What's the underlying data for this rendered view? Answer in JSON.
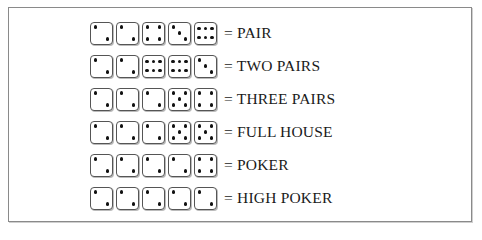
{
  "hands": [
    {
      "dice": [
        2,
        2,
        4,
        3,
        6
      ],
      "label": "= PAIR"
    },
    {
      "dice": [
        2,
        2,
        6,
        6,
        3
      ],
      "label": "= TWO PAIRS"
    },
    {
      "dice": [
        2,
        2,
        2,
        5,
        4
      ],
      "label": "= THREE PAIRS"
    },
    {
      "dice": [
        2,
        2,
        2,
        5,
        5
      ],
      "label": "= FULL HOUSE"
    },
    {
      "dice": [
        2,
        2,
        2,
        2,
        4
      ],
      "label": "= POKER"
    },
    {
      "dice": [
        2,
        2,
        2,
        2,
        2
      ],
      "label": "= HIGH POKER"
    }
  ],
  "colors": {
    "border": "#8a8a8a",
    "pip": "#111111",
    "text": "#1a1a1a"
  }
}
